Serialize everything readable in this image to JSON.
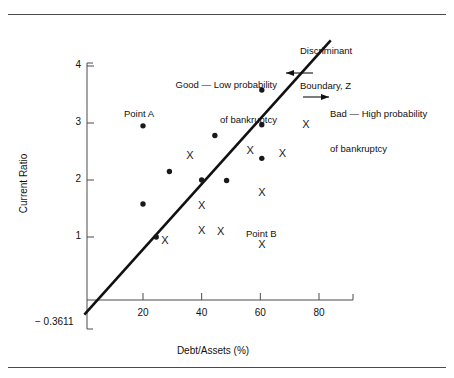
{
  "chart_data": {
    "type": "scatter",
    "title": "",
    "xlabel": "Debt/Assets (%)",
    "ylabel": "Current Ratio",
    "xlim": [
      0,
      97
    ],
    "ylim": [
      -0.55,
      4.35
    ],
    "xticks": [
      20,
      40,
      60,
      80
    ],
    "yticks": [
      4,
      3,
      2,
      1
    ],
    "grid": false,
    "legend_position": "none",
    "y_axis_origin_label": "− 0.3611",
    "series": [
      {
        "name": "Good — Low probability of bankruptcy",
        "marker": "dot",
        "points": [
          {
            "x": 20.0,
            "y": 2.95,
            "label": "Point A"
          },
          {
            "x": 20.0,
            "y": 1.58
          },
          {
            "x": 24.5,
            "y": 1.0
          },
          {
            "x": 29.0,
            "y": 2.15
          },
          {
            "x": 40.0,
            "y": 2.0
          },
          {
            "x": 44.5,
            "y": 2.78
          },
          {
            "x": 48.5,
            "y": 1.99
          },
          {
            "x": 60.5,
            "y": 3.58
          },
          {
            "x": 60.5,
            "y": 2.97
          },
          {
            "x": 60.5,
            "y": 2.38
          }
        ]
      },
      {
        "name": "Bad — High probability of bankruptcy",
        "marker": "x",
        "points": [
          {
            "x": 27.5,
            "y": 0.94
          },
          {
            "x": 36.0,
            "y": 2.43
          },
          {
            "x": 40.0,
            "y": 1.55
          },
          {
            "x": 40.0,
            "y": 1.12
          },
          {
            "x": 46.5,
            "y": 1.1
          },
          {
            "x": 56.5,
            "y": 2.52
          },
          {
            "x": 60.5,
            "y": 1.78
          },
          {
            "x": 60.5,
            "y": 0.86,
            "label": "Point B"
          },
          {
            "x": 67.5,
            "y": 2.46
          },
          {
            "x": 75.5,
            "y": 2.98
          }
        ]
      }
    ],
    "boundary": {
      "name": "Discriminant Boundary, Z",
      "x_start": 0.0,
      "y_start": -0.3611,
      "x_end": 84.0,
      "y_end": 4.45
    },
    "annotations": [
      {
        "name": "discriminant-boundary",
        "line1": "Discriminant",
        "line2": "Boundary, Z"
      },
      {
        "name": "good-region",
        "line1": "Good — Low probability",
        "line2": "of bankruptcy",
        "arrow": "left"
      },
      {
        "name": "bad-region",
        "line1": "Bad — High probability",
        "line2": "of bankruptcy",
        "arrow": "right"
      },
      {
        "name": "point-a",
        "text": "Point A"
      },
      {
        "name": "point-b",
        "text": "Point B"
      }
    ]
  },
  "axes": {
    "ylabel": "Current Ratio",
    "xlabel": "Debt/Assets (%)",
    "origin_label": "− 0.3611",
    "xtick_labels": [
      "20",
      "40",
      "60",
      "80"
    ],
    "ytick_labels": [
      "4",
      "3",
      "2",
      "1"
    ]
  },
  "annotations": {
    "discriminant_line1": "Discriminant",
    "discriminant_line2": "Boundary, Z",
    "good_line1": "Good — Low probability",
    "good_line2": "of bankruptcy",
    "bad_line1": "Bad — High probability",
    "bad_line2": "of bankruptcy",
    "point_a": "Point A",
    "point_b": "Point B"
  },
  "colors": {
    "ink": "#111111",
    "rule": "#4a4a4a",
    "background": "#ffffff"
  }
}
